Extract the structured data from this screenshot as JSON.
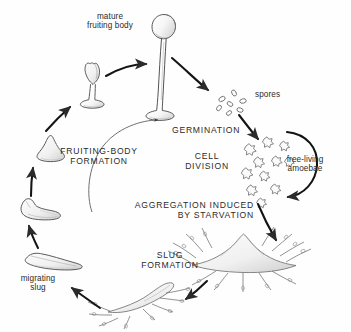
{
  "diagram": {
    "background_color": "#fefefe",
    "ink_color": "#2b2b2b",
    "fill_color": "#f2f2f2"
  },
  "labels": {
    "mature_fruiting_body": "mature\nfruiting body",
    "spores": "spores",
    "germination": "GERMINATION",
    "cell_division": "CELL\nDIVISION",
    "free_living_amoebae": "free-living\namoebae",
    "aggregation": "AGGREGATION INDUCED\nBY STARVATION",
    "slug_formation": "SLUG\nFORMATION",
    "migrating_slug": "migrating\nslug",
    "fruiting_body_formation": "FRUITING-BODY\nFORMATION"
  },
  "stages": [
    {
      "name": "mature-fruiting-body",
      "label": "mature fruiting body"
    },
    {
      "name": "spores",
      "label": "spores"
    },
    {
      "name": "free-living-amoebae",
      "label": "free-living amoebae"
    },
    {
      "name": "aggregation-mound",
      "label": "aggregation mound"
    },
    {
      "name": "slug-formation",
      "label": "slug formation"
    },
    {
      "name": "migrating-slug",
      "label": "migrating slug"
    },
    {
      "name": "culminating-slug",
      "label": "culminating slug"
    },
    {
      "name": "mound",
      "label": "mound"
    },
    {
      "name": "developing-fruiting-body",
      "label": "developing fruiting body"
    }
  ],
  "processes": [
    {
      "name": "germination",
      "label": "GERMINATION"
    },
    {
      "name": "cell-division",
      "label": "CELL DIVISION"
    },
    {
      "name": "aggregation-induced-by-starvation",
      "label": "AGGREGATION INDUCED BY STARVATION"
    },
    {
      "name": "slug-formation",
      "label": "SLUG FORMATION"
    },
    {
      "name": "fruiting-body-formation",
      "label": "FRUITING-BODY FORMATION"
    }
  ]
}
